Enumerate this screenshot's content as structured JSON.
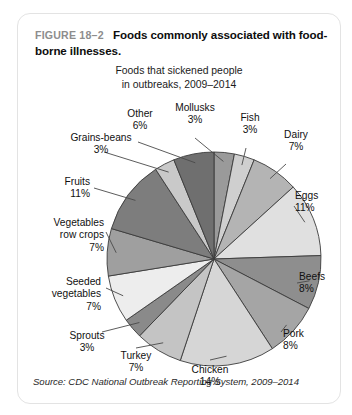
{
  "figure": {
    "number": "FIGURE 18–2",
    "caption": "Foods commonly associated with food-borne illnesses."
  },
  "source": "Source: CDC National Outbreak Reporting System, 2009–2014",
  "chart_data": {
    "type": "pie",
    "title": "Foods that sickened people in outbreaks, 2009–2014",
    "subtitle_line1": "Foods that sickened people",
    "subtitle_line2": "in outbreaks, 2009–2014",
    "xlabel": "",
    "ylabel": "",
    "legend": "none",
    "grid": false,
    "value_unit": "%",
    "categories": [
      "Mollusks",
      "Fish",
      "Dairy",
      "Eggs",
      "Beefs",
      "Pork",
      "Chicken",
      "Turkey",
      "Sprouts",
      "Seeded vegetables",
      "Vegetables row crops",
      "Fruits",
      "Grains-beans",
      "Other"
    ],
    "values": [
      3,
      3,
      7,
      11,
      8,
      8,
      14,
      7,
      3,
      7,
      7,
      11,
      3,
      6
    ],
    "slices": [
      {
        "label": "Mollusks",
        "value": 3,
        "pct_text": "3%",
        "color": "#9a9a9a"
      },
      {
        "label": "Fish",
        "value": 3,
        "pct_text": "3%",
        "color": "#cfcfcf"
      },
      {
        "label": "Dairy",
        "value": 7,
        "pct_text": "7%",
        "color": "#b4b4b4"
      },
      {
        "label": "Eggs",
        "value": 11,
        "pct_text": "11%",
        "color": "#e0e0e0"
      },
      {
        "label": "Beefs",
        "value": 8,
        "pct_text": "8%",
        "color": "#8e8e8e"
      },
      {
        "label": "Pork",
        "value": 8,
        "pct_text": "8%",
        "color": "#a5a5a5"
      },
      {
        "label": "Chicken",
        "value": 14,
        "pct_text": "14%",
        "color": "#d6d6d6"
      },
      {
        "label": "Turkey",
        "value": 7,
        "pct_text": "7%",
        "color": "#c4c4c4"
      },
      {
        "label": "Sprouts",
        "value": 3,
        "pct_text": "3%",
        "color": "#8a8a8a"
      },
      {
        "label": "Seeded vegetables",
        "value": 7,
        "pct_text": "7%",
        "color": "#ededed"
      },
      {
        "label": "Vegetables row crops",
        "value": 7,
        "pct_text": "7%",
        "color": "#9f9f9f"
      },
      {
        "label": "Fruits",
        "value": 11,
        "pct_text": "11%",
        "color": "#7d7d7d"
      },
      {
        "label": "Grains-beans",
        "value": 3,
        "pct_text": "3%",
        "color": "#c9c9c9"
      },
      {
        "label": "Other",
        "value": 6,
        "pct_text": "6%",
        "color": "#6f6f6f"
      }
    ]
  },
  "colors": {
    "card_border": "#e3e3e3",
    "figure_number": "#8d8d8d",
    "slice_outline": "#3b3b3b",
    "leader_line": "#4a4a4a"
  }
}
